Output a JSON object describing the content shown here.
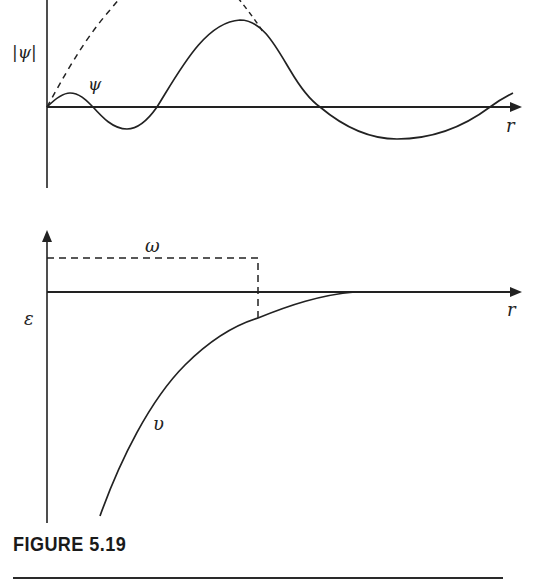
{
  "figure": {
    "caption": "FIGURE 5.19",
    "colors": {
      "ink": "#222222",
      "background": "#ffffff"
    }
  },
  "top_panel": {
    "y_axis_label": "|ψ|",
    "curve_label": "ψ",
    "x_axis_label": "r",
    "curves": [
      {
        "name": "psi",
        "style": "solid",
        "description": "oscillating wavefunction with growing amplitude then decaying"
      },
      {
        "name": "abs_psi_envelope",
        "style": "dashed",
        "description": "envelope |ψ| rising from origin"
      }
    ]
  },
  "bottom_panel": {
    "y_axis_label": "ε",
    "well_label": "ω",
    "curve_label": "υ",
    "x_axis_label": "r",
    "curves": [
      {
        "name": "potential_v",
        "style": "solid",
        "description": "attractive potential rising toward zero as r increases"
      },
      {
        "name": "square_well_omega",
        "style": "dashed",
        "description": "rectangular level/width marker"
      }
    ]
  }
}
